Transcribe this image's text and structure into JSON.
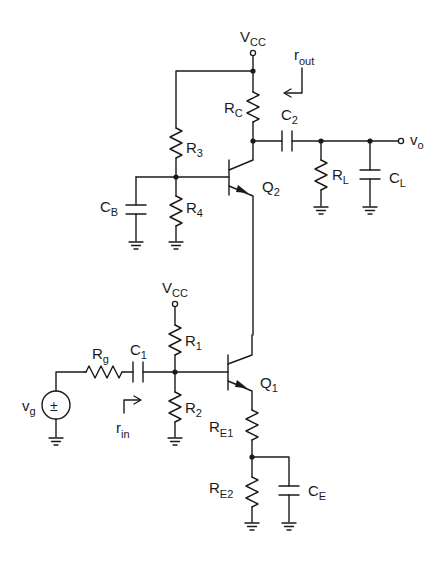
{
  "diagram": {
    "type": "circuit-schematic",
    "colors": {
      "ink": "#1a1a1a",
      "background": "#ffffff"
    },
    "labels": {
      "vcc_top": {
        "main": "V",
        "sub": "CC"
      },
      "vcc_bottom": {
        "main": "V",
        "sub": "CC"
      },
      "r_out": {
        "main": "r",
        "sub": "out"
      },
      "r_in": {
        "main": "r",
        "sub": "in"
      },
      "rc": {
        "main": "R",
        "sub": "C"
      },
      "c2": {
        "main": "C",
        "sub": "2"
      },
      "rl": {
        "main": "R",
        "sub": "L"
      },
      "cl": {
        "main": "C",
        "sub": "L"
      },
      "vo": {
        "main": "v",
        "sub": "o"
      },
      "r3": {
        "main": "R",
        "sub": "3"
      },
      "r4": {
        "main": "R",
        "sub": "4"
      },
      "cb": {
        "main": "C",
        "sub": "B"
      },
      "q2": {
        "main": "Q",
        "sub": "2"
      },
      "r1": {
        "main": "R",
        "sub": "1"
      },
      "r2": {
        "main": "R",
        "sub": "2"
      },
      "q1": {
        "main": "Q",
        "sub": "1"
      },
      "rg": {
        "main": "R",
        "sub": "g"
      },
      "c1": {
        "main": "C",
        "sub": "1"
      },
      "vg": {
        "main": "v",
        "sub": "g"
      },
      "vg_symbol": "±",
      "re1": {
        "main": "R",
        "sub": "E1"
      },
      "re2": {
        "main": "R",
        "sub": "E2"
      },
      "ce": {
        "main": "C",
        "sub": "E"
      }
    },
    "components": [
      {
        "id": "Q1",
        "kind": "npn-bjt"
      },
      {
        "id": "Q2",
        "kind": "npn-bjt"
      },
      {
        "id": "RC",
        "kind": "resistor"
      },
      {
        "id": "R1",
        "kind": "resistor"
      },
      {
        "id": "R2",
        "kind": "resistor"
      },
      {
        "id": "R3",
        "kind": "resistor"
      },
      {
        "id": "R4",
        "kind": "resistor"
      },
      {
        "id": "RE1",
        "kind": "resistor"
      },
      {
        "id": "RE2",
        "kind": "resistor"
      },
      {
        "id": "Rg",
        "kind": "resistor"
      },
      {
        "id": "RL",
        "kind": "resistor"
      },
      {
        "id": "C1",
        "kind": "capacitor"
      },
      {
        "id": "C2",
        "kind": "capacitor"
      },
      {
        "id": "CB",
        "kind": "capacitor"
      },
      {
        "id": "CE",
        "kind": "capacitor"
      },
      {
        "id": "CL",
        "kind": "capacitor"
      },
      {
        "id": "vg",
        "kind": "voltage-source"
      }
    ]
  }
}
